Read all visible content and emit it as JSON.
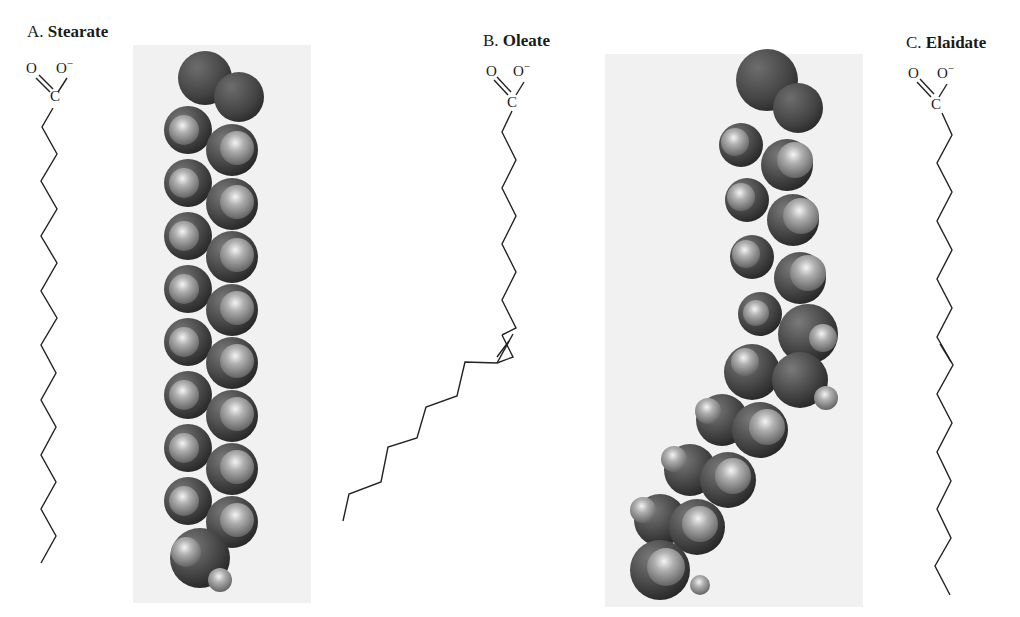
{
  "figure": {
    "panels": [
      {
        "letter": "A.",
        "name": "Stearate",
        "carboxylate": {
          "carbonyl_O": "O",
          "oxide_O": "O",
          "charge": "−",
          "carbon": "C"
        },
        "double_bond": "none",
        "model": "space-filling, straight chain"
      },
      {
        "letter": "B.",
        "name": "Oleate",
        "carboxylate": {
          "carbonyl_O": "O",
          "oxide_O": "O",
          "charge": "−",
          "carbon": "C"
        },
        "double_bond": "cis",
        "model": "space-filling, kinked chain"
      },
      {
        "letter": "C.",
        "name": "Elaidate",
        "carboxylate": {
          "carbonyl_O": "O",
          "oxide_O": "O",
          "charge": "−",
          "carbon": "C"
        },
        "double_bond": "trans",
        "model": "none"
      }
    ],
    "colors": {
      "bond": "#222222",
      "panel_bg": "#f1f1f1",
      "carbon_oxygen_sphere": "#4a4a4a",
      "hydrogen_sphere": "#b8b8b8"
    }
  }
}
